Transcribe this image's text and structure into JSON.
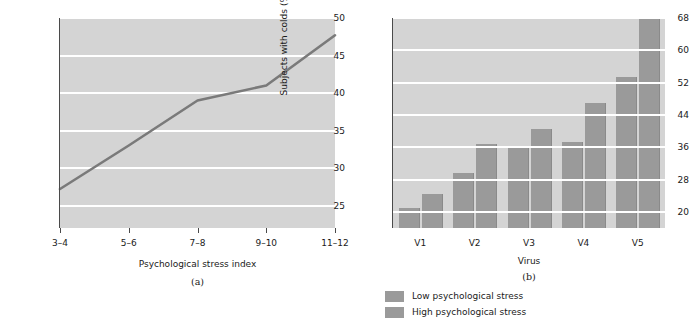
{
  "figure": {
    "background": "#ffffff",
    "plot_background": "#d4d4d4",
    "gridline_color": "#ffffff",
    "line_color": "#7a7a7a",
    "bar_color": "#9a9a9a",
    "text_color": "#1a1a1a"
  },
  "panel_a": {
    "caption": "(a)",
    "chart_data": {
      "type": "line",
      "title": "",
      "xlabel": "Psychological stress index",
      "ylabel": "Subjects with colds (%)",
      "categories": [
        "3–4",
        "5–6",
        "7–8",
        "9–10",
        "11–12"
      ],
      "values": [
        27.2,
        33.0,
        39.0,
        41.0,
        47.7
      ],
      "series": [
        {
          "name": "Subjects with colds",
          "values": [
            27.2,
            33.0,
            39.0,
            41.0,
            47.7
          ]
        }
      ],
      "yticks": [
        25,
        30,
        35,
        40,
        45,
        50
      ],
      "ytick_labels": [
        "25",
        "30",
        "35",
        "40",
        "45",
        "50"
      ],
      "xtick_labels": [
        "3–4",
        "5–6",
        "7–8",
        "9–10",
        "11–12"
      ],
      "ylim": [
        22,
        50
      ],
      "grid": true,
      "legend": "none"
    }
  },
  "panel_b": {
    "caption": "(b)",
    "chart_data": {
      "type": "bar",
      "title": "",
      "xlabel": "Virus",
      "ylabel": "Subjects with colds (%)",
      "categories": [
        "V1",
        "V2",
        "V3",
        "V4",
        "V5"
      ],
      "series": [
        {
          "name": "Low psychological stress",
          "values": [
            21.0,
            29.5,
            36.0,
            37.3,
            53.5
          ]
        },
        {
          "name": "High psychological stress",
          "values": [
            24.5,
            36.8,
            40.5,
            47.0,
            67.7
          ]
        }
      ],
      "yticks": [
        20,
        28,
        36,
        44,
        52,
        60,
        68
      ],
      "ytick_labels": [
        "20",
        "28",
        "36",
        "44",
        "52",
        "60",
        "68"
      ],
      "xtick_labels": [
        "V1",
        "V2",
        "V3",
        "V4",
        "V5"
      ],
      "ylim": [
        16,
        68
      ],
      "grid": true,
      "legend_position": "bottom",
      "legend": [
        "Low psychological stress",
        "High psychological stress"
      ]
    }
  }
}
